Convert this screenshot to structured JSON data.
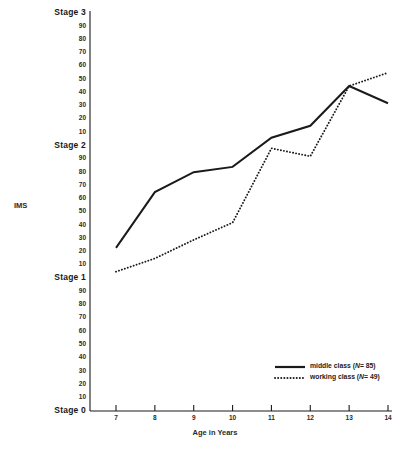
{
  "chart_data": {
    "type": "line",
    "title": "",
    "xlabel": "Age in Years",
    "ylabel": "IMS",
    "x": [
      7,
      8,
      9,
      10,
      11,
      12,
      13,
      14
    ],
    "xtick_labels": [
      "7",
      "8",
      "9",
      "10",
      "11",
      "12",
      "13",
      "14"
    ],
    "xlim": [
      7,
      14
    ],
    "ylim": [
      0,
      300
    ],
    "grid": false,
    "legend_position": "bottom-right",
    "ytick_labels": [
      "Stage 3",
      "90",
      "80",
      "70",
      "60",
      "50",
      "40",
      "30",
      "20",
      "10",
      "Stage 2",
      "90",
      "80",
      "70",
      "60",
      "50",
      "40",
      "30",
      "20",
      "10",
      "Stage 1",
      "90",
      "80",
      "70",
      "60",
      "50",
      "40",
      "30",
      "20",
      "10",
      "Stage 0"
    ],
    "ytick_values": [
      300,
      290,
      280,
      270,
      260,
      250,
      240,
      230,
      220,
      210,
      200,
      190,
      180,
      170,
      160,
      150,
      140,
      130,
      120,
      110,
      100,
      90,
      80,
      70,
      60,
      50,
      40,
      30,
      20,
      10,
      0
    ],
    "stage_labels": [
      "Stage 0",
      "Stage 1",
      "Stage 2",
      "Stage 3"
    ],
    "series": [
      {
        "name": "middle class (N= 85)",
        "label_plain": "middle class",
        "n_prefix": "(",
        "n_italic": "N",
        "n_suffix": "= 85)",
        "style": "solid",
        "color": "#1a1a1a",
        "values": [
          123,
          165,
          180,
          184,
          206,
          215,
          245,
          232
        ]
      },
      {
        "name": "working class (N= 49)",
        "label_plain": "working class",
        "n_prefix": "(",
        "n_italic": "N",
        "n_suffix": "= 49)",
        "style": "dotted",
        "color": "#1a1a1a",
        "values": [
          105,
          115,
          129,
          142,
          198,
          192,
          245,
          255
        ]
      }
    ]
  },
  "axes": {
    "y_axis_name": "y-axis-line",
    "x_axis_name": "x-axis-line"
  }
}
